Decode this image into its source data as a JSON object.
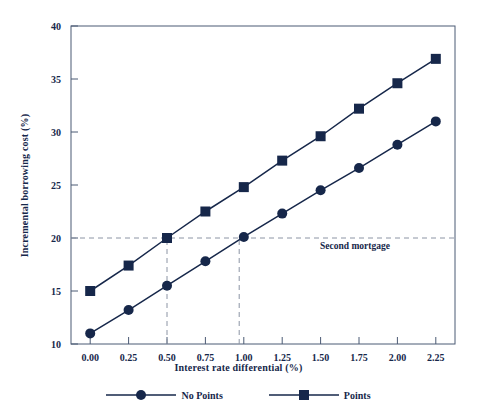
{
  "chart_data": {
    "type": "line",
    "title": "",
    "xlabel": "Interest rate differential (%)",
    "ylabel": "Incremental borrowing cost  (%)",
    "xlim": [
      -0.125,
      2.375
    ],
    "ylim": [
      10,
      40
    ],
    "grid": false,
    "legend_position": "bottom",
    "x": [
      0.0,
      0.25,
      0.5,
      0.75,
      1.0,
      1.25,
      1.5,
      1.75,
      2.0,
      2.25
    ],
    "xtick_labels": [
      "0.00",
      "0.25",
      "0.50",
      "0.75",
      "1.00",
      "1.25",
      "1.50",
      "1.75",
      "2.00",
      "2.25"
    ],
    "ytick_labels": [
      "10",
      "15",
      "20",
      "25",
      "30",
      "35",
      "40"
    ],
    "yticks": [
      10,
      15,
      20,
      25,
      30,
      35,
      40
    ],
    "series": [
      {
        "name": "No Points",
        "marker": "circle",
        "color": "#16274a",
        "values": [
          11.0,
          13.2,
          15.5,
          17.8,
          20.1,
          22.3,
          24.5,
          26.6,
          28.8,
          31.0
        ]
      },
      {
        "name": "Points",
        "marker": "square",
        "color": "#16274a",
        "values": [
          15.0,
          17.4,
          20.0,
          22.5,
          24.8,
          27.3,
          29.6,
          32.2,
          34.6,
          36.9
        ]
      }
    ],
    "annotations": [
      {
        "text": "Second mortgage",
        "type": "reference-line-label",
        "y": 20
      }
    ],
    "reference_lines": [
      {
        "orientation": "horizontal",
        "y": 20,
        "style": "dashed"
      },
      {
        "orientation": "vertical",
        "x": 0.5,
        "y_from": 10,
        "y_to": 20,
        "style": "dashed"
      },
      {
        "orientation": "vertical",
        "x": 0.97,
        "y_from": 10,
        "y_to": 20,
        "style": "dashed"
      }
    ]
  },
  "colors": {
    "series": "#16274a",
    "axis": "#4b5a74",
    "dashed": "#8c94a4",
    "background": "#ffffff"
  },
  "legend": {
    "items": [
      {
        "label": "No Points",
        "marker": "circle"
      },
      {
        "label": "Points",
        "marker": "square"
      }
    ]
  }
}
